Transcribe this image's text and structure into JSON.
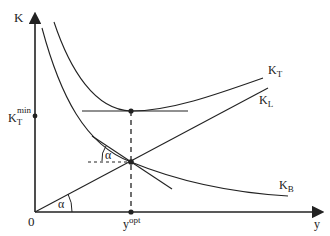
{
  "diagram": {
    "axes": {
      "y_label": "K",
      "x_label": "y",
      "origin_label": "0"
    },
    "curves": {
      "total_cost": {
        "label": "K",
        "subscript": "T"
      },
      "linear_cost": {
        "label": "K",
        "subscript": "L"
      },
      "variable_cost": {
        "label": "K",
        "subscript": "B"
      }
    },
    "annotations": {
      "kt_min": {
        "label": "K",
        "subscript": "T",
        "superscript": "min"
      },
      "y_opt": {
        "label": "y",
        "superscript": "opt"
      },
      "angle_origin": "α",
      "angle_tangent": "α"
    },
    "colors": {
      "line": "#222222",
      "background": "#ffffff"
    }
  }
}
